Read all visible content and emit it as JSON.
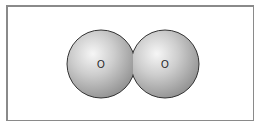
{
  "diagram": {
    "type": "space-filling molecular model",
    "molecule": "O2",
    "atoms": [
      {
        "label": "O",
        "cx": 101,
        "cy": 64,
        "r": 34
      },
      {
        "label": "O",
        "cx": 165,
        "cy": 64,
        "r": 34
      }
    ],
    "colors": {
      "sphere_highlight": "#f4f4f4",
      "sphere_mid": "#c4c4c4",
      "sphere_shadow": "#8e8e8e",
      "outline": "#333333",
      "frame": "#8a8a8a"
    }
  }
}
